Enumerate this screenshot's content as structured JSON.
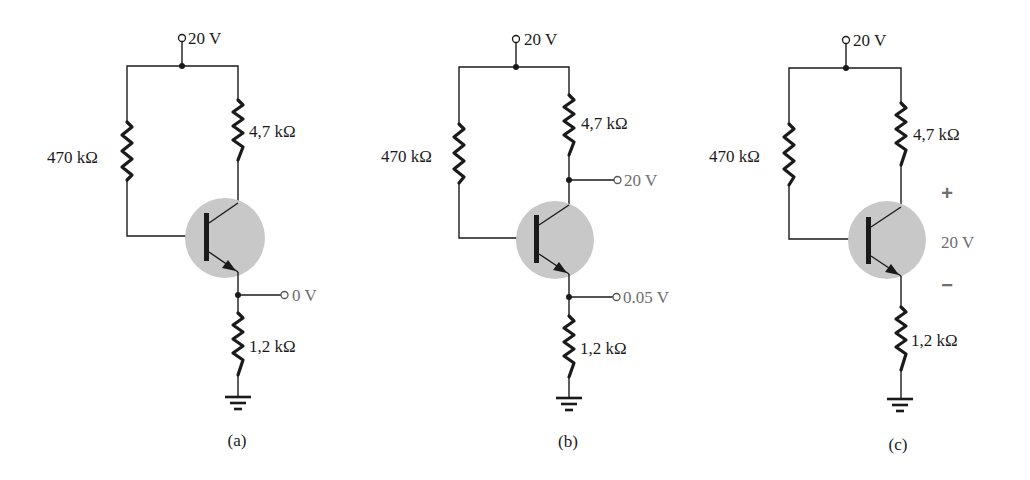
{
  "figure": {
    "colors": {
      "wire": "#1a1a1a",
      "transistor_highlight": "#c8c8c8",
      "measured_label": "#6e6e6e"
    },
    "circuits": [
      {
        "id": "a",
        "caption": "(a)",
        "supply_label": "20 V",
        "rb_label": "470 kΩ",
        "rc_label": "4,7 kΩ",
        "re_label": "1,2 kΩ",
        "emitter_probe_label": "0 V"
      },
      {
        "id": "b",
        "caption": "(b)",
        "supply_label": "20 V",
        "rb_label": "470 kΩ",
        "rc_label": "4,7 kΩ",
        "re_label": "1,2 kΩ",
        "collector_probe_label": "20 V",
        "emitter_probe_label": "0.05 V"
      },
      {
        "id": "c",
        "caption": "(c)",
        "supply_label": "20 V",
        "rb_label": "470 kΩ",
        "rc_label": "4,7 kΩ",
        "re_label": "1,2 kΩ",
        "vce_plus": "+",
        "vce_label": "20 V",
        "vce_minus": "−"
      }
    ]
  }
}
